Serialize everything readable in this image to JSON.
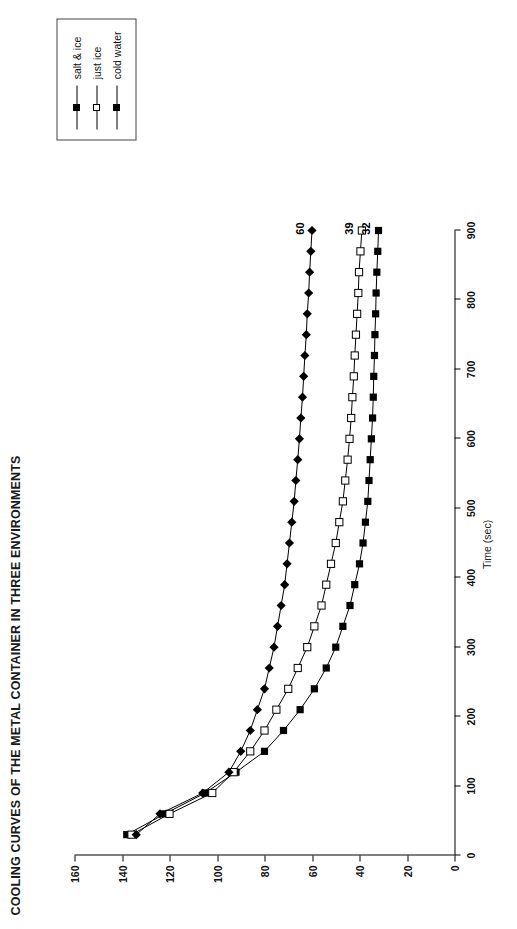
{
  "title": "COOLING CURVES OF THE METAL CONTAINER IN THREE ENVIRONMENTS",
  "legend": {
    "items": [
      {
        "label": "salt & ice",
        "marker": "filled-square-marker"
      },
      {
        "label": "just ice",
        "marker": "open-square-marker"
      },
      {
        "label": "cold water",
        "marker": "filled-diamond-marker"
      }
    ]
  },
  "axes": {
    "x_title": "Time (sec)",
    "x_ticks": [
      "0",
      "100",
      "200",
      "300",
      "400",
      "500",
      "600",
      "700",
      "800",
      "900"
    ],
    "y_ticks": [
      "0",
      "20",
      "40",
      "60",
      "80",
      "100",
      "120",
      "140",
      "160"
    ]
  },
  "end_labels": {
    "cold_water": "60",
    "just_ice": "39",
    "salt_ice": "32"
  },
  "chart_data": {
    "type": "line",
    "title": "COOLING CURVES OF THE METAL CONTAINER IN THREE ENVIRONMENTS",
    "xlabel": "Time (sec)",
    "ylabel": "",
    "xlim": [
      0,
      900
    ],
    "ylim": [
      0,
      160
    ],
    "grid": false,
    "legend_position": "right",
    "x": [
      30,
      60,
      90,
      120,
      150,
      180,
      210,
      240,
      270,
      300,
      330,
      360,
      390,
      420,
      450,
      480,
      510,
      540,
      570,
      600,
      630,
      660,
      690,
      720,
      750,
      780,
      810,
      840,
      870,
      900
    ],
    "series": [
      {
        "name": "salt & ice",
        "marker": "filled-square-marker",
        "end_label": "32",
        "values": [
          138,
          122,
          105,
          92,
          80,
          72,
          65,
          59,
          54,
          50,
          47,
          44,
          42,
          40,
          38.5,
          37.5,
          36.5,
          36,
          35.5,
          35,
          34.5,
          34.2,
          34,
          33.7,
          33.5,
          33.2,
          33,
          32.7,
          32.3,
          32
        ]
      },
      {
        "name": "just ice",
        "marker": "open-square-marker",
        "end_label": "39",
        "values": [
          136,
          120,
          102,
          93,
          86,
          80,
          75,
          70,
          66,
          62,
          59,
          56,
          54,
          52,
          50,
          48.5,
          47,
          46,
          45,
          44.2,
          43.5,
          43,
          42.4,
          42,
          41.5,
          41,
          40.5,
          40.2,
          39.6,
          39
        ]
      },
      {
        "name": "cold water",
        "marker": "filled-diamond-marker",
        "end_label": "60",
        "values": [
          134,
          124,
          106,
          95,
          90,
          86,
          83,
          80,
          78,
          76,
          74.5,
          73,
          71.5,
          70.5,
          69.5,
          68.5,
          67.5,
          66.8,
          66,
          65.3,
          64.7,
          64,
          63.5,
          63,
          62.4,
          62,
          61.4,
          61,
          60.5,
          60
        ]
      }
    ]
  }
}
